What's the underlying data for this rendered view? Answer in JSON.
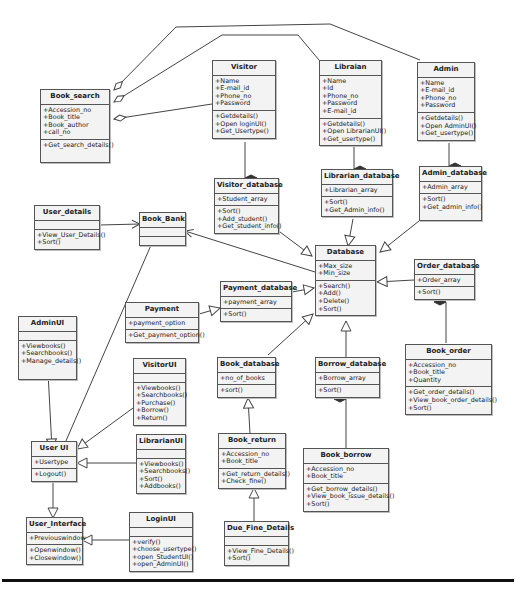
{
  "diagram": {
    "type": "UML class diagram"
  },
  "classes": {
    "book_search": {
      "name": "Book_search",
      "attributes": [
        "+Accession_no",
        "+Book_title",
        "+Book_author",
        "+call_no"
      ],
      "methods": [
        "+Get_search_details()"
      ]
    },
    "visitor": {
      "name": "Visitor",
      "attributes": [
        "+Name",
        "+E-mail_id",
        "+Phone_no",
        "+Password"
      ],
      "methods": [
        "+Getdetails()",
        "+Open loginUI()",
        "+Get_Usertype()"
      ]
    },
    "librarian": {
      "name": "Libraian",
      "attributes": [
        "+Name",
        "+Id",
        "+Phone_no",
        "+Password",
        "+E-mail_id"
      ],
      "methods": [
        "+Getdetails()",
        "+Open LibrarianUI()",
        "+Get_usertype()"
      ]
    },
    "admin": {
      "name": "Admin",
      "attributes": [
        "+Name",
        "+E-mail_id",
        "+Phone_no",
        "+Password"
      ],
      "methods": [
        "+Getdetails()",
        "+Open  AdminUI()",
        "+Get_usertype()"
      ]
    },
    "visitor_database": {
      "name": "Visitor_database",
      "attributes": [
        "+Student_array"
      ],
      "methods": [
        "+Sort()",
        "+Add_student()",
        "+Get_student_info()"
      ]
    },
    "librarian_database": {
      "name": "Librarian_database",
      "attributes": [
        "+Librarian_array"
      ],
      "methods": [
        "+Sort()",
        "+Get_Admin_info()"
      ]
    },
    "admin_database": {
      "name": "Admin_database",
      "attributes": [
        "+Admin_array"
      ],
      "methods": [
        "+Sort()",
        "+Get_admin_info()"
      ]
    },
    "user_details": {
      "name": "User_details",
      "attributes": [],
      "methods": [
        "+View_User_Details()",
        "+Sort()"
      ]
    },
    "book_bank": {
      "name": "Book_Bank",
      "attributes": [],
      "methods": []
    },
    "database": {
      "name": "Database",
      "attributes": [
        "+Max_size",
        "+Min_size"
      ],
      "methods": [
        "+Search()",
        "+Add()",
        "+Delete()",
        "+Sort()"
      ]
    },
    "order_database": {
      "name": "Order_database",
      "attributes": [
        "+Order_array"
      ],
      "methods": [
        "+Sort()"
      ]
    },
    "payment": {
      "name": "Payment",
      "attributes": [
        "+payment_option"
      ],
      "methods": [
        "+Get_payment_option()"
      ]
    },
    "payment_database": {
      "name": "Payment_database",
      "attributes": [
        "+payment_array"
      ],
      "methods": [
        "+Sort()"
      ]
    },
    "admin_ui": {
      "name": "AdminUI",
      "attributes": [],
      "methods": [
        "+Viewbooks()",
        "+Searchbooks()",
        "+Manage_details()"
      ]
    },
    "visitor_ui": {
      "name": "VisitorUI",
      "attributes": [],
      "methods": [
        "+Viewbooks()",
        "+Searchbooks()",
        "+Purchase()",
        "+Borrow()",
        "+Return()"
      ]
    },
    "book_database": {
      "name": "Book_database",
      "attributes": [
        "+no_of_books"
      ],
      "methods": [
        "+sort()"
      ]
    },
    "borrow_database": {
      "name": "Borrow_database",
      "attributes": [
        "+Borrow_array"
      ],
      "methods": [
        "+Sort()"
      ]
    },
    "book_order": {
      "name": "Book_order",
      "attributes": [
        "+Accession_no",
        "+Book_title",
        "+Quantity"
      ],
      "methods": [
        "+Get_order_details()",
        "+View_book_order_details()",
        "+Sort()"
      ]
    },
    "user_ui": {
      "name": "User UI",
      "attributes": [
        "+Usertype"
      ],
      "methods": [
        "+Logout()"
      ]
    },
    "librarian_ui": {
      "name": "LibrarianUI",
      "attributes": [],
      "methods": [
        "+Viewbooks()",
        "+Searchbooks()",
        "+Sort()",
        "+Addbooks()"
      ]
    },
    "book_return": {
      "name": "Book_return",
      "attributes": [
        "+Accession_no",
        "+Book_title"
      ],
      "methods": [
        "+Get_return_details()",
        "+Check_fine()"
      ]
    },
    "book_borrow": {
      "name": "Book_borrow",
      "attributes": [
        "+Accession_no",
        "+Book_title"
      ],
      "methods": [
        "+Get_borrow_details()",
        "+View_book_issue_details()",
        "+Sort()"
      ]
    },
    "user_interface": {
      "name": "User_Interface",
      "attributes": [
        "+Previouswindow"
      ],
      "methods": [
        "+Openwindow()",
        "+Closewindow()"
      ]
    },
    "login_ui": {
      "name": "LoginUI",
      "attributes": [],
      "methods": [
        "+verify()",
        "+choose_usertype()",
        "+open_StudentUI()",
        "+open_AdminUI()"
      ]
    },
    "due_fine_details": {
      "name": "Due_Fine_Details",
      "attributes": [],
      "methods": [
        "+View_Fine_Details()",
        "+Sort()"
      ]
    }
  },
  "relationships": [
    {
      "from": "Book_search",
      "to": "Visitor",
      "kind": "aggregation"
    },
    {
      "from": "Book_search",
      "to": "Libraian",
      "kind": "aggregation"
    },
    {
      "from": "Book_search",
      "to": "Admin",
      "kind": "aggregation"
    },
    {
      "from": "Visitor",
      "to": "Visitor_database",
      "kind": "composition"
    },
    {
      "from": "Libraian",
      "to": "Librarian_database",
      "kind": "composition"
    },
    {
      "from": "Admin",
      "to": "Admin_database",
      "kind": "composition"
    },
    {
      "from": "Visitor_database",
      "to": "Database",
      "kind": "generalization"
    },
    {
      "from": "Librarian_database",
      "to": "Database",
      "kind": "generalization"
    },
    {
      "from": "Admin_database",
      "to": "Database",
      "kind": "generalization"
    },
    {
      "from": "Order_database",
      "to": "Database",
      "kind": "generalization"
    },
    {
      "from": "Payment_database",
      "to": "Database",
      "kind": "generalization"
    },
    {
      "from": "Book_database",
      "to": "Database",
      "kind": "generalization"
    },
    {
      "from": "Borrow_database",
      "to": "Database",
      "kind": "generalization"
    },
    {
      "from": "Database",
      "to": "Book_Bank",
      "kind": "association"
    },
    {
      "from": "User_details",
      "to": "Book_Bank",
      "kind": "association"
    },
    {
      "from": "User UI",
      "to": "Book_Bank",
      "kind": "association"
    },
    {
      "from": "Payment",
      "to": "Payment_database",
      "kind": "generalization"
    },
    {
      "from": "Order_database",
      "to": "Book_order",
      "kind": "composition"
    },
    {
      "from": "Borrow_database",
      "to": "Book_borrow",
      "kind": "composition"
    },
    {
      "from": "Book_return",
      "to": "Book_database",
      "kind": "generalization"
    },
    {
      "from": "Due_Fine_Details",
      "to": "Book_return",
      "kind": "generalization"
    },
    {
      "from": "AdminUI",
      "to": "User UI",
      "kind": "generalization"
    },
    {
      "from": "VisitorUI",
      "to": "User UI",
      "kind": "generalization"
    },
    {
      "from": "LibrarianUI",
      "to": "User UI",
      "kind": "generalization"
    },
    {
      "from": "User UI",
      "to": "User_Interface",
      "kind": "generalization"
    },
    {
      "from": "LoginUI",
      "to": "User_Interface",
      "kind": "generalization"
    }
  ]
}
